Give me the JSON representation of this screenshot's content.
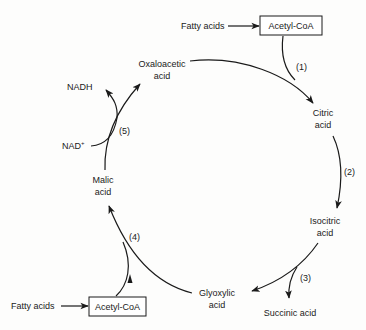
{
  "diagram": {
    "type": "metabolic-cycle",
    "nodes": {
      "oxaloacetic": {
        "line1": "Oxaloacetic",
        "line2": "acid"
      },
      "citric": {
        "line1": "Citric",
        "line2": "acid"
      },
      "isocitric": {
        "line1": "Isocitric",
        "line2": "acid"
      },
      "glyoxylic": {
        "line1": "Glyoxylic",
        "line2": "acid"
      },
      "malic": {
        "line1": "Malic",
        "line2": "acid"
      },
      "succinic": {
        "label": "Succinic acid"
      },
      "nadh": {
        "label": "NADH"
      },
      "nad": {
        "label": "NAD",
        "superscript": "+"
      },
      "fatty_acids_top": {
        "label": "Fatty acids"
      },
      "acetyl_coa_top": {
        "label": "Acetyl-CoA"
      },
      "fatty_acids_bottom": {
        "label": "Fatty acids"
      },
      "acetyl_coa_bottom": {
        "label": "Acetyl-CoA"
      }
    },
    "steps": {
      "s1": "(1)",
      "s2": "(2)",
      "s3": "(3)",
      "s4": "(4)",
      "s5": "(5)"
    },
    "edges": [
      {
        "from": "Fatty acids",
        "to": "Acetyl-CoA"
      },
      {
        "from": "Oxaloacetic acid",
        "to": "Citric acid",
        "step": "(1)",
        "cofactor_in": "Acetyl-CoA"
      },
      {
        "from": "Citric acid",
        "to": "Isocitric acid",
        "step": "(2)"
      },
      {
        "from": "Isocitric acid",
        "to": "Glyoxylic acid",
        "step": "(3)",
        "side_product": "Succinic acid"
      },
      {
        "from": "Glyoxylic acid",
        "to": "Malic acid",
        "step": "(4)",
        "cofactor_in": "Acetyl-CoA"
      },
      {
        "from": "Malic acid",
        "to": "Oxaloacetic acid",
        "step": "(5)",
        "cofactor_in": "NAD+",
        "cofactor_out": "NADH"
      },
      {
        "from": "Fatty acids",
        "to": "Acetyl-CoA"
      }
    ]
  }
}
